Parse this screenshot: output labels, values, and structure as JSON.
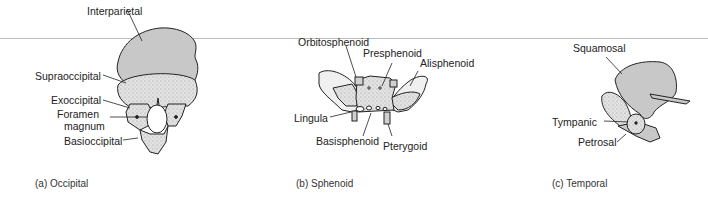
{
  "colors": {
    "bone_fill": "#c8c8c8",
    "stipple_fill": "#d9d9d9",
    "outline": "#222222",
    "rule": "#bdbdbd"
  },
  "panels": [
    {
      "caption": "(a) Occipital",
      "labels": {
        "interparietal": "Interparietal",
        "supraoccipital": "Supraoccipital",
        "exoccipital": "Exoccipital",
        "foramen_magnum_1": "Foramen",
        "foramen_magnum_2": "magnum",
        "basioccipital": "Basioccipital"
      }
    },
    {
      "caption": "(b) Sphenoid",
      "labels": {
        "orbitosphenoid": "Orbitosphenoid",
        "presphenoid": "Presphenoid",
        "alisphenoid": "Alisphenoid",
        "lingula": "Lingula",
        "basisphenoid": "Basisphenoid",
        "pterygoid": "Pterygoid"
      }
    },
    {
      "caption": "(c) Temporal",
      "labels": {
        "squamosal": "Squamosal",
        "tympanic": "Tympanic",
        "petrosal": "Petrosal"
      }
    }
  ]
}
